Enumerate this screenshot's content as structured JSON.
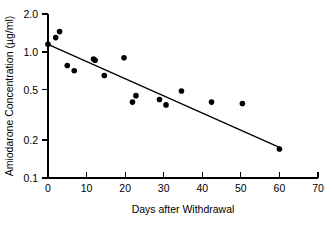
{
  "chart_data": {
    "type": "scatter",
    "title": "",
    "xlabel": "Days after Withdrawal",
    "ylabel": "Amiodarone Concentration (µg/ml)",
    "xlim": [
      0,
      70
    ],
    "ylim": [
      0.1,
      2.0
    ],
    "yscale": "log",
    "xscale": "linear",
    "grid": false,
    "legend": null,
    "xticks": [
      0,
      10,
      20,
      30,
      40,
      50,
      60,
      70
    ],
    "xtick_labels": [
      "0",
      "10",
      "20",
      "30",
      "40",
      "50",
      "60",
      "70"
    ],
    "yticks": [
      0.1,
      0.2,
      0.5,
      1.0,
      2.0
    ],
    "ytick_labels": [
      "0.1",
      "0.2",
      "0.5",
      "1.0",
      "2.0"
    ],
    "series": [
      {
        "name": "Amiodarone concentration",
        "marker": "filled-circle",
        "color": "#000000",
        "points": [
          {
            "x": 0.0,
            "y": 1.15
          },
          {
            "x": 2.0,
            "y": 1.3
          },
          {
            "x": 3.0,
            "y": 1.45
          },
          {
            "x": 5.0,
            "y": 0.78
          },
          {
            "x": 6.8,
            "y": 0.71
          },
          {
            "x": 11.8,
            "y": 0.88
          },
          {
            "x": 12.2,
            "y": 0.86
          },
          {
            "x": 14.6,
            "y": 0.65
          },
          {
            "x": 19.7,
            "y": 0.9
          },
          {
            "x": 21.9,
            "y": 0.4
          },
          {
            "x": 22.8,
            "y": 0.45
          },
          {
            "x": 28.9,
            "y": 0.42
          },
          {
            "x": 30.6,
            "y": 0.38
          },
          {
            "x": 34.6,
            "y": 0.49
          },
          {
            "x": 42.4,
            "y": 0.4
          },
          {
            "x": 50.4,
            "y": 0.39
          },
          {
            "x": 60.0,
            "y": 0.17
          }
        ]
      }
    ],
    "fit_line": {
      "name": "regression-line",
      "color": "#000000",
      "x_start": 0.0,
      "y_start": 1.15,
      "x_end": 60.0,
      "y_end": 0.175
    }
  }
}
